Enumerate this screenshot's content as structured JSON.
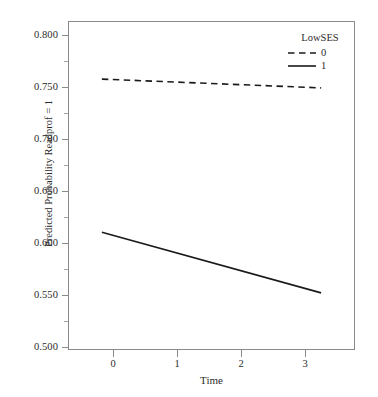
{
  "chart_data": {
    "type": "line",
    "title": "",
    "xlabel": "Time",
    "ylabel": "Predicted Probability Readprof = 1",
    "xlim": [
      -0.45,
      3.45
    ],
    "ylim": [
      0.4805,
      0.8155
    ],
    "xticks": [
      "0",
      "1",
      "2",
      "3"
    ],
    "xtick_values": [
      0,
      1,
      2,
      3
    ],
    "yticks": [
      "0.500",
      "0.550",
      "0.600",
      "0.650",
      "0.700",
      "0.750",
      "0.800"
    ],
    "ytick_values": [
      0.5,
      0.55,
      0.6,
      0.65,
      0.7,
      0.75,
      0.8
    ],
    "grid": false,
    "legend_position": "top-right-inside",
    "legend_title": "LowSES",
    "x": [
      0,
      3
    ],
    "series": [
      {
        "name": "0",
        "style": "dashed",
        "color": "#1a1a1a",
        "values": [
          0.757,
          0.748
        ]
      },
      {
        "name": "1",
        "style": "solid",
        "color": "#1a1a1a",
        "values": [
          0.6,
          0.538
        ]
      }
    ]
  },
  "axes": {
    "y_title": "Predicted Probability Readprof = 1",
    "x_title": "Time",
    "y_tick_labels": [
      "0.800",
      "0.750",
      "0.700",
      "0.650",
      "0.600",
      "0.550",
      "0.500"
    ],
    "x_tick_labels": [
      "0",
      "1",
      "2",
      "3"
    ]
  },
  "legend": {
    "title": "LowSES",
    "entries": [
      {
        "label": "0",
        "style": "dashed"
      },
      {
        "label": "1",
        "style": "solid"
      }
    ]
  }
}
